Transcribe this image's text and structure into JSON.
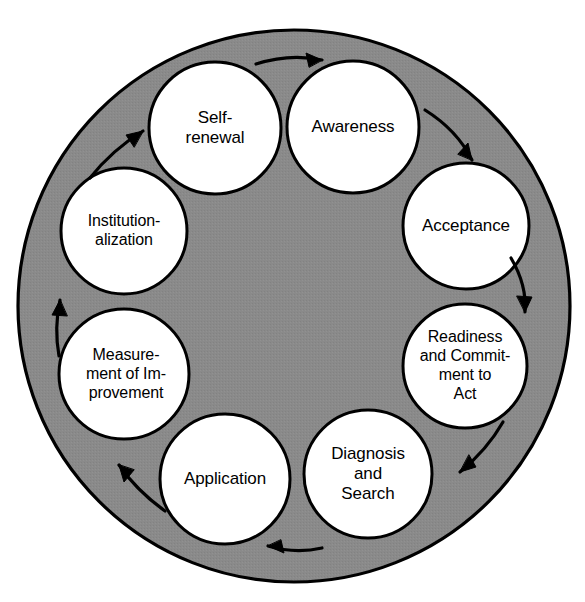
{
  "diagram": {
    "type": "cyclic-process-wheel",
    "colors": {
      "background": "#ffffff",
      "disc_fill": "#8a8a8a",
      "node_fill": "#ffffff",
      "stroke": "#000000",
      "text": "#000000"
    },
    "disc": {
      "cx": 294,
      "cy": 306,
      "r": 276
    },
    "direction": "clockwise",
    "nodes": [
      {
        "id": "awareness",
        "label": "Awareness",
        "lines": [
          "Awareness"
        ],
        "order": 1,
        "cx": 353,
        "cy": 127,
        "r": 66
      },
      {
        "id": "acceptance",
        "label": "Acceptance",
        "lines": [
          "Acceptance"
        ],
        "order": 2,
        "cx": 466,
        "cy": 226,
        "r": 63
      },
      {
        "id": "readiness-commitment",
        "label": "Readiness and Commitment to Act",
        "lines": [
          "Readiness",
          "and Commit-",
          "ment to",
          "Act"
        ],
        "order": 3,
        "cx": 465,
        "cy": 366,
        "r": 62
      },
      {
        "id": "diagnosis-search",
        "label": "Diagnosis and Search",
        "lines": [
          "Diagnosis",
          "and",
          "Search"
        ],
        "order": 4,
        "cx": 368,
        "cy": 474,
        "r": 64
      },
      {
        "id": "application",
        "label": "Application",
        "lines": [
          "Application"
        ],
        "order": 5,
        "cx": 225,
        "cy": 479,
        "r": 65
      },
      {
        "id": "measurement-improvement",
        "label": "Measurement of Improvement",
        "lines": [
          "Measure-",
          "ment of Im-",
          "provement"
        ],
        "order": 6,
        "cx": 124,
        "cy": 374,
        "r": 65
      },
      {
        "id": "institutionalization",
        "label": "Institutionalization",
        "lines": [
          "Institution-",
          "alization"
        ],
        "order": 7,
        "cx": 124,
        "cy": 231,
        "r": 63
      },
      {
        "id": "self-renewal",
        "label": "Self-renewal",
        "lines": [
          "Self-",
          "renewal"
        ],
        "order": 8,
        "cx": 215,
        "cy": 128,
        "r": 66
      }
    ],
    "arrows": [
      {
        "id": "arrow-self-renewal-to-awareness",
        "from": "self-renewal",
        "to": "awareness",
        "name": "arrow-self-renewal-to-awareness"
      },
      {
        "id": "arrow-awareness-to-acceptance",
        "from": "awareness",
        "to": "acceptance",
        "name": "arrow-awareness-to-acceptance"
      },
      {
        "id": "arrow-acceptance-to-readiness",
        "from": "acceptance",
        "to": "readiness-commitment",
        "name": "arrow-acceptance-to-readiness"
      },
      {
        "id": "arrow-readiness-to-diagnosis",
        "from": "readiness-commitment",
        "to": "diagnosis-search",
        "name": "arrow-readiness-to-diagnosis"
      },
      {
        "id": "arrow-diagnosis-to-application",
        "from": "diagnosis-search",
        "to": "application",
        "name": "arrow-diagnosis-to-application"
      },
      {
        "id": "arrow-application-to-measurement",
        "from": "application",
        "to": "measurement-improvement",
        "name": "arrow-application-to-measurement"
      },
      {
        "id": "arrow-measurement-to-institutionalization",
        "from": "measurement-improvement",
        "to": "institutionalization",
        "name": "arrow-measurement-to-institutionalization"
      },
      {
        "id": "arrow-institutionalization-to-self-renewal",
        "from": "institutionalization",
        "to": "self-renewal",
        "name": "arrow-institutionalization-to-self-renewal"
      }
    ]
  }
}
